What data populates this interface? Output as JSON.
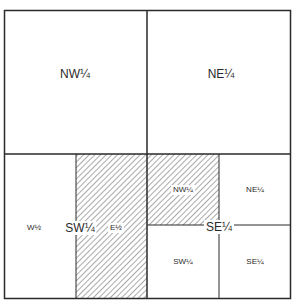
{
  "diagram": {
    "title": "",
    "type": "section subdivision (public land survey)",
    "colors": {
      "line": "#2a2a2a",
      "hatch": "#555555",
      "background": "#ffffff"
    },
    "quarters": [
      {
        "id": "nw",
        "label": "NW¼"
      },
      {
        "id": "ne",
        "label": "NE¼"
      },
      {
        "id": "sw",
        "label": "SW¼",
        "halves": [
          {
            "id": "sw-w-half",
            "label": "W½",
            "hatched": false
          },
          {
            "id": "sw-e-half",
            "label": "E½",
            "hatched": true
          }
        ]
      },
      {
        "id": "se",
        "label": "SE¼",
        "quarters": [
          {
            "id": "se-nw",
            "label": "NW¼",
            "hatched": true
          },
          {
            "id": "se-ne",
            "label": "NE¼",
            "hatched": false
          },
          {
            "id": "se-sw",
            "label": "SW¼",
            "hatched": false
          },
          {
            "id": "se-se",
            "label": "SE¼",
            "hatched": false
          }
        ]
      }
    ]
  }
}
